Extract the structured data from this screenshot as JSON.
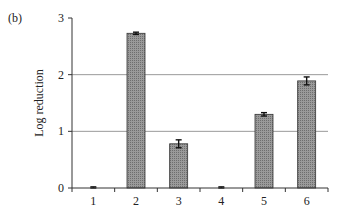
{
  "panel_label": "(b)",
  "chart_data": {
    "type": "bar",
    "title": "",
    "xlabel": "",
    "ylabel": "Log reduction",
    "categories": [
      "1",
      "2",
      "3",
      "4",
      "5",
      "6"
    ],
    "values": [
      0.01,
      2.73,
      0.78,
      0.01,
      1.3,
      1.89
    ],
    "errors": [
      0.01,
      0.02,
      0.07,
      0.01,
      0.03,
      0.07
    ],
    "ylim": [
      0,
      3
    ],
    "yticks": [
      "0",
      "1",
      "2",
      "3"
    ],
    "grid": true,
    "gridlines_at": [
      1,
      2
    ],
    "legend": null,
    "bar_fill": "#8a8a8a"
  }
}
